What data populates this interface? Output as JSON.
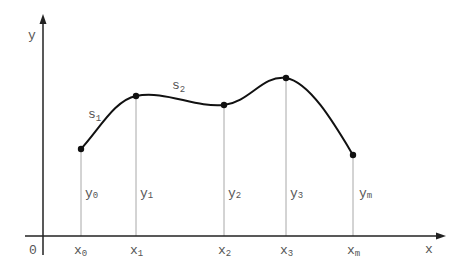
{
  "diagram": {
    "type": "spline-interpolation",
    "axes": {
      "x_label": "x",
      "y_label": "y",
      "origin_label": "0"
    },
    "points": [
      {
        "x_label": "x",
        "x_sub": "0",
        "y_label": "y",
        "y_sub": "0",
        "px": 81,
        "py": 149
      },
      {
        "x_label": "x",
        "x_sub": "1",
        "y_label": "y",
        "y_sub": "1",
        "px": 136,
        "py": 96
      },
      {
        "x_label": "x",
        "x_sub": "2",
        "y_label": "y",
        "y_sub": "2",
        "px": 224,
        "py": 105
      },
      {
        "x_label": "x",
        "x_sub": "3",
        "y_label": "y",
        "y_sub": "3",
        "px": 286,
        "py": 78
      },
      {
        "x_label": "x",
        "x_sub": "m",
        "y_label": "y",
        "y_sub": "m",
        "px": 353,
        "py": 155
      }
    ],
    "segments": [
      {
        "label": "s",
        "sub": "1"
      },
      {
        "label": "s",
        "sub": "2"
      }
    ],
    "colors": {
      "axis": "#222222",
      "curve": "#111111",
      "guide": "#999999",
      "text": "#555555"
    }
  }
}
